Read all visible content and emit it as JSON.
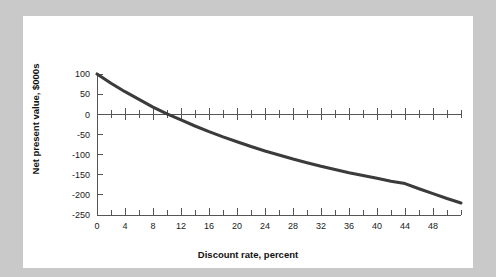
{
  "figure": {
    "background_color": "#c9c9c9",
    "panel_color": "#ffffff"
  },
  "chart_data": {
    "type": "line",
    "title": "",
    "xlabel": "Discount rate, percent",
    "ylabel": "Net present value, $000s",
    "xlim": [
      0,
      52
    ],
    "ylim": [
      -250,
      100
    ],
    "grid": false,
    "legend": null,
    "series_color": "#3b3b3b",
    "x_major_ticks": [
      0,
      4,
      8,
      12,
      16,
      20,
      24,
      28,
      32,
      36,
      40,
      44,
      48
    ],
    "x_major_tick_labels": [
      "0",
      "4",
      "8",
      "12",
      "16",
      "20",
      "24",
      "28",
      "32",
      "36",
      "40",
      "44",
      "48"
    ],
    "x_minor_ticks": [
      2,
      6,
      10,
      14,
      18,
      22,
      26,
      30,
      34,
      38,
      42,
      46,
      50,
      52
    ],
    "y_ticks": [
      100,
      50,
      0,
      -50,
      -100,
      -150,
      -200,
      -250
    ],
    "y_tick_labels": [
      "100",
      "50",
      "0",
      "-50",
      "-100",
      "-150",
      "-200",
      "-250"
    ],
    "zero_line": 0,
    "series": [
      {
        "name": "Net present value",
        "x": [
          0,
          2,
          4,
          6,
          8,
          10,
          12,
          14,
          16,
          18,
          20,
          22,
          24,
          26,
          28,
          30,
          32,
          34,
          36,
          38,
          40,
          42,
          44,
          46,
          48,
          50,
          52
        ],
        "values": [
          100,
          77,
          56,
          37,
          18,
          1,
          -14,
          -29,
          -43,
          -56,
          -68,
          -80,
          -91,
          -101,
          -111,
          -120,
          -129,
          -137,
          -145,
          -152,
          -159,
          -166,
          -172,
          -185,
          -197,
          -209,
          -220
        ]
      }
    ],
    "annotations": [
      {
        "label": "zero crossing (IRR)",
        "x": 10,
        "y": 0
      }
    ]
  }
}
